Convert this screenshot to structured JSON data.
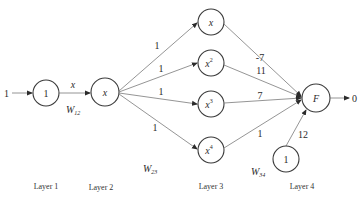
{
  "diagram": {
    "type": "neural-network",
    "input": {
      "value": "1"
    },
    "output": {
      "value": "0"
    },
    "layers": [
      {
        "label": "Layer 1",
        "nodes": [
          {
            "label": "1"
          }
        ]
      },
      {
        "label": "Layer 2",
        "nodes": [
          {
            "label": "x"
          }
        ]
      },
      {
        "label": "Layer 3",
        "nodes": [
          {
            "label": "x",
            "sup": ""
          },
          {
            "label": "x",
            "sup": "2"
          },
          {
            "label": "x",
            "sup": "3"
          },
          {
            "label": "x",
            "sup": "4"
          }
        ]
      },
      {
        "label": "Layer 4",
        "nodes": [
          {
            "label": "F"
          },
          {
            "label": "1"
          }
        ]
      }
    ],
    "weights": {
      "w12": {
        "name": "W",
        "sub": "12",
        "edge_label": "x"
      },
      "w23": {
        "name": "W",
        "sub": "23",
        "values": [
          "1",
          "1",
          "1",
          "1"
        ]
      },
      "w34": {
        "name": "W",
        "sub": "34",
        "values": [
          "-7",
          "11",
          "7",
          "1"
        ],
        "bias": "12"
      }
    }
  }
}
